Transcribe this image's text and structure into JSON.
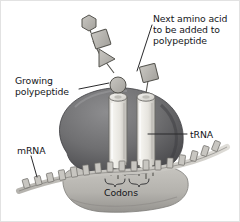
{
  "figure": {
    "background_color": "#ffffff",
    "border_color": "#e2e2e2",
    "text_color": "#15161a"
  },
  "labels": {
    "next_amino_acid": "Next amino acid\nto be added to\npolypeptide",
    "growing_polypeptide": "Growing\npolypeptide",
    "trna": "tRNA",
    "mrna": "mRNA",
    "codons": "Codons"
  },
  "diagram": {
    "palette": {
      "ribosome_large_subunit": "#6f6f71",
      "ribosome_large_subunit_shadow": "#4e4e51",
      "ribosome_small_subunit": "#b9b7b2",
      "ribosome_small_subunit_shadow": "#918f8b",
      "trna_body": "#efeeea",
      "trna_shadow": "#c3c1bb",
      "trna_outline": "#6a6965",
      "amino_acid_fill": "#b4b2ad",
      "amino_acid_outline": "#55544f",
      "mrna_strand": "#cfcdc8",
      "mrna_base": "#c8c6c1",
      "mrna_outline": "#6e6c68",
      "leader_line": "#2a2a2c",
      "brace": "#3a3a3c"
    },
    "polypeptide_chain": [
      {
        "shape": "hexagon",
        "name": "amino-acid-hexagon"
      },
      {
        "shape": "diamond",
        "name": "amino-acid-diamond"
      },
      {
        "shape": "triangle",
        "name": "amino-acid-triangle"
      },
      {
        "shape": "circle",
        "name": "amino-acid-circle"
      }
    ],
    "incoming_amino_acid": {
      "shape": "square",
      "name": "amino-acid-square"
    },
    "trna_count": 2,
    "codon_brace_count": 2
  }
}
